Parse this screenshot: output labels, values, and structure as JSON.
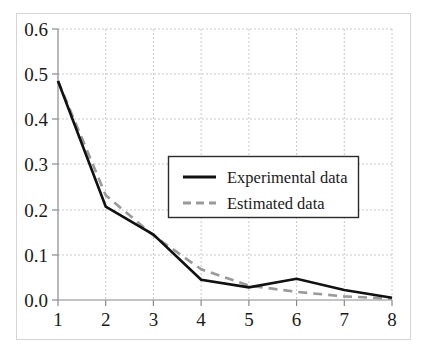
{
  "chart_data": {
    "type": "line",
    "title": "",
    "xlabel": "",
    "ylabel": "",
    "x": [
      1,
      2,
      3,
      4,
      5,
      6,
      7,
      8
    ],
    "xtick_labels": [
      "1",
      "2",
      "3",
      "4",
      "5",
      "6",
      "7",
      "8"
    ],
    "ytick_labels": [
      "0.0",
      "0.1",
      "0.2",
      "0.3",
      "0.4",
      "0.5",
      "0.6"
    ],
    "ytick_values": [
      0.0,
      0.1,
      0.2,
      0.3,
      0.4,
      0.5,
      0.6
    ],
    "xlim": [
      1,
      8
    ],
    "ylim": [
      0.0,
      0.6
    ],
    "grid": true,
    "grid_style": "dotted",
    "legend_position": "center",
    "series": [
      {
        "name": "Experimental data",
        "style": "solid",
        "color": "#111111",
        "values": [
          0.485,
          0.207,
          0.145,
          0.045,
          0.028,
          0.047,
          0.022,
          0.005
        ]
      },
      {
        "name": "Estimated data",
        "style": "dashed",
        "color": "#9a9a9a",
        "values": [
          0.485,
          0.232,
          0.143,
          0.068,
          0.032,
          0.018,
          0.008,
          0.003
        ]
      }
    ]
  },
  "legend": {
    "entries": [
      {
        "label": "Experimental data"
      },
      {
        "label": "Estimated data"
      }
    ]
  },
  "colors": {
    "experimental": "#111111",
    "estimated": "#9a9a9a",
    "grid": "#c8c8c8",
    "axis": "#8a8a8a",
    "border": "#d0d0d0",
    "background": "#ffffff"
  }
}
